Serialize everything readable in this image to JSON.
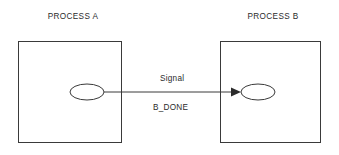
{
  "diagram": {
    "type": "process-signal-diagram",
    "background_color": "#ffffff",
    "stroke_color": "#3a3a3a",
    "text_color": "#2b2b2b",
    "processes": [
      {
        "id": "process-a",
        "title": "PROCESS A",
        "title_x": 73,
        "title_y": 19,
        "box": {
          "x": 18,
          "y": 41,
          "width": 104,
          "height": 102
        },
        "node": {
          "cx": 87,
          "cy": 92,
          "rx": 17,
          "ry": 8
        }
      },
      {
        "id": "process-b",
        "title": "PROCESS B",
        "title_x": 273,
        "title_y": 19,
        "box": {
          "x": 220,
          "y": 41,
          "width": 101,
          "height": 102
        },
        "node": {
          "cx": 258,
          "cy": 92,
          "rx": 17,
          "ry": 8
        }
      }
    ],
    "connection": {
      "id": "signal-arrow",
      "from": "process-a",
      "to": "process-b",
      "label_primary": "Signal",
      "label_secondary": "B_DONE",
      "label_primary_x": 160,
      "label_primary_y": 81,
      "label_secondary_x": 153,
      "label_secondary_y": 110,
      "line_x1": 104,
      "line_x2": 234,
      "line_y": 92,
      "arrow_tip_x": 241,
      "arrow_back_x": 231,
      "arrow_half_height": 4.5
    }
  }
}
